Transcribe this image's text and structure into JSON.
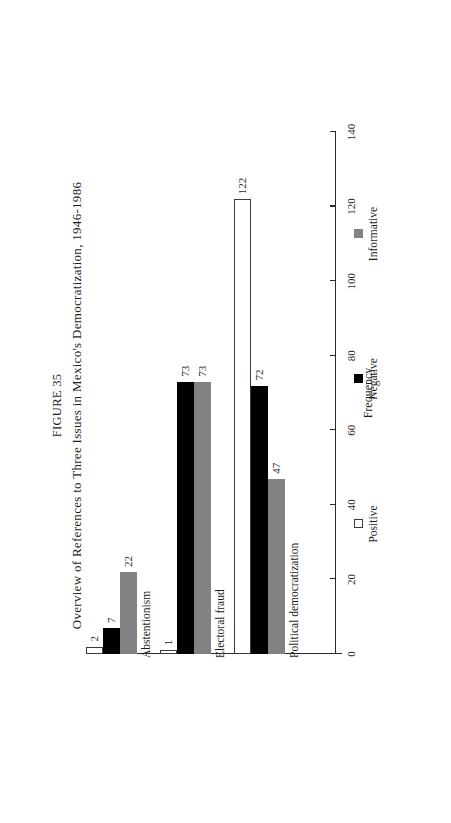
{
  "figure": {
    "label": "FIGURE 35",
    "caption": "Overview of References to Three Issues in Mexico's Democratization, 1946-1986"
  },
  "axis": {
    "value_axis_title": "Frequency",
    "ticks": [
      "0",
      "20",
      "40",
      "60",
      "80",
      "100",
      "120",
      "140"
    ]
  },
  "legend": {
    "items": [
      {
        "label": "Positive",
        "swatch": "white-square-icon",
        "color": "#ffffff"
      },
      {
        "label": "Negative",
        "swatch": "black-square-icon",
        "color": "#000000"
      },
      {
        "label": "Informative",
        "swatch": "gray-square-icon",
        "color": "#828282"
      }
    ]
  },
  "chart_data": {
    "type": "bar",
    "title": "Overview of References to Three Issues in Mexico's Democratization, 1946-1986",
    "xlabel": "",
    "ylabel": "Frequency",
    "ylim": [
      0,
      140
    ],
    "ytick_step": 20,
    "grid": false,
    "orientation": "vertical",
    "legend_position": "bottom",
    "categories": [
      "Political democratization",
      "Electoral fraud",
      "Abstentionism"
    ],
    "series": [
      {
        "name": "Positive",
        "color": "#ffffff",
        "values": [
          122,
          1,
          2
        ]
      },
      {
        "name": "Negative",
        "color": "#000000",
        "values": [
          72,
          73,
          7
        ]
      },
      {
        "name": "Informative",
        "color": "#828282",
        "values": [
          47,
          73,
          22
        ]
      }
    ],
    "data_labels": {
      "Political democratization": {
        "Positive": "122",
        "Negative": "72",
        "Informative": "47"
      },
      "Electoral fraud": {
        "Positive": "1",
        "Negative": "73",
        "Informative": "73"
      },
      "Abstentionism": {
        "Positive": "2",
        "Negative": "7",
        "Informative": "22"
      }
    }
  }
}
